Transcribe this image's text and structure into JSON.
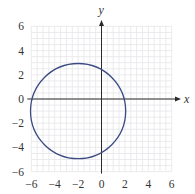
{
  "chart_data": {
    "type": "line",
    "title": "",
    "xlabel": "x",
    "ylabel": "y",
    "xlim": [
      -6,
      6
    ],
    "ylim": [
      -6,
      6
    ],
    "x_ticks": [
      -6,
      -4,
      -2,
      0,
      2,
      4,
      6
    ],
    "y_ticks": [
      -6,
      -4,
      -2,
      0,
      2,
      4,
      6
    ],
    "x_tick_labels": [
      "−6",
      "−4",
      "−2",
      "0",
      "2",
      "4",
      "6"
    ],
    "y_tick_labels": [
      "−6",
      "−4",
      "−2",
      "0",
      "2",
      "4",
      "6"
    ],
    "grid": true,
    "grid_step": 0.5,
    "series": [
      {
        "name": "circle",
        "shape": "circle",
        "center": [
          -2,
          -1
        ],
        "radius": 4,
        "equation": "(x + 2)^2 + (y + 1)^2 = 16",
        "color": "#3b4a82"
      }
    ]
  },
  "colors": {
    "axis": "#2a2a2a",
    "grid": "#e6e6ea",
    "curve": "#3b4a82",
    "text": "#333333"
  }
}
